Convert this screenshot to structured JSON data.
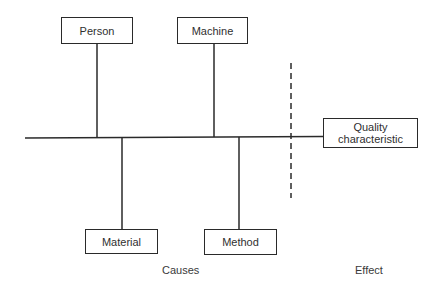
{
  "diagram": {
    "type": "cause-and-effect (fishbone)",
    "causes_top": [
      {
        "label": "Person"
      },
      {
        "label": "Machine"
      }
    ],
    "causes_bottom": [
      {
        "label": "Material"
      },
      {
        "label": "Method"
      }
    ],
    "effect": {
      "label_line1": "Quality",
      "label_line2": "characteristic"
    },
    "captions": {
      "causes": "Causes",
      "effect": "Effect"
    },
    "colors": {
      "line": "#2a2a2a",
      "background": "#ffffff",
      "text": "#2f2f2f"
    }
  }
}
